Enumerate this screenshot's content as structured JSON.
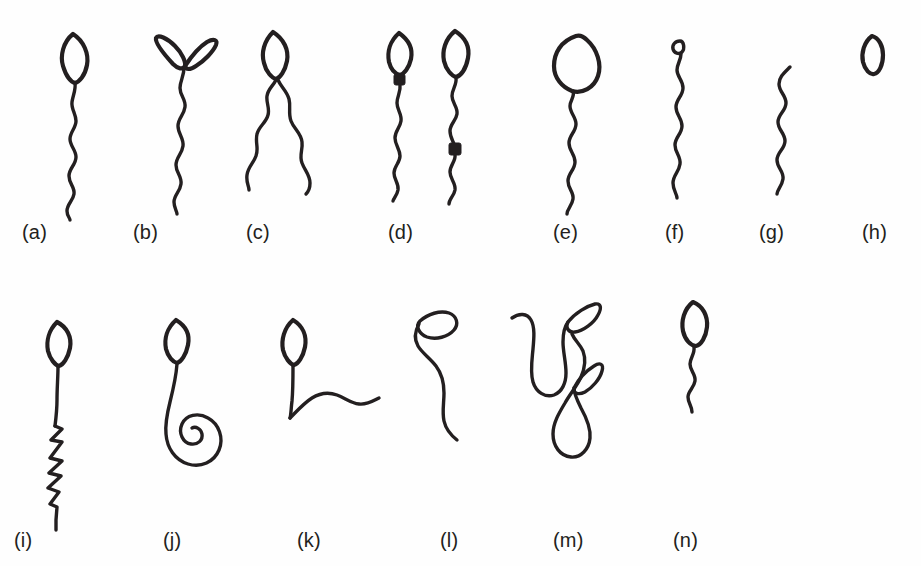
{
  "figure": {
    "background_color": "#fefefe",
    "ink_color": "#231f20",
    "width": 921,
    "height": 566,
    "rows": 2,
    "columns": 8,
    "panel_count": 14
  },
  "labels": {
    "a": "(a)",
    "b": "(b)",
    "c": "(c)",
    "d": "(d)",
    "e": "(e)",
    "f": "(f)",
    "g": "(g)",
    "h": "(h)",
    "i": "(i)",
    "j": "(j)",
    "k": "(k)",
    "l": "(l)",
    "m": "(m)",
    "n": "(n)"
  },
  "panels": [
    {
      "id": "a",
      "label": "(a)",
      "row": 1,
      "index": 1,
      "description": "normal sperm, oval head with wavy tail",
      "head_count": 1,
      "tail_count": 1,
      "droplets": 0
    },
    {
      "id": "b",
      "label": "(b)",
      "row": 1,
      "index": 2,
      "description": "double head, two oval heads on single wavy tail",
      "head_count": 2,
      "tail_count": 1,
      "droplets": 0
    },
    {
      "id": "c",
      "label": "(c)",
      "row": 1,
      "index": 3,
      "description": "double tail, single head with two tails",
      "head_count": 1,
      "tail_count": 2,
      "droplets": 0
    },
    {
      "id": "d",
      "label": "(d)",
      "row": 1,
      "index": 4,
      "description": "two sperm with cytoplasmic droplets, proximal droplet at neck and distal droplet at midpiece",
      "head_count": 2,
      "tail_count": 2,
      "droplets": 2
    },
    {
      "id": "e",
      "label": "(e)",
      "row": 1,
      "index": 5,
      "description": "macrocephalic, enlarged round head",
      "head_count": 1,
      "tail_count": 1,
      "droplets": 0
    },
    {
      "id": "f",
      "label": "(f)",
      "row": 1,
      "index": 6,
      "description": "microcephalic, very small head",
      "head_count": 1,
      "tail_count": 1,
      "droplets": 0
    },
    {
      "id": "g",
      "label": "(g)",
      "row": 1,
      "index": 7,
      "description": "headless tail, free flagellum only",
      "head_count": 0,
      "tail_count": 1,
      "droplets": 0
    },
    {
      "id": "h",
      "label": "(h)",
      "row": 1,
      "index": 8,
      "description": "isolated head, no tail",
      "head_count": 1,
      "tail_count": 0,
      "droplets": 0
    },
    {
      "id": "i",
      "label": "(i)",
      "row": 2,
      "index": 1,
      "description": "zigzag kinked tail",
      "head_count": 1,
      "tail_count": 1,
      "droplets": 0
    },
    {
      "id": "j",
      "label": "(j)",
      "row": 2,
      "index": 2,
      "description": "coiled tail, spiral at distal end",
      "head_count": 1,
      "tail_count": 1,
      "droplets": 0
    },
    {
      "id": "k",
      "label": "(k)",
      "row": 2,
      "index": 3,
      "description": "sharply bent tail at midpiece",
      "head_count": 1,
      "tail_count": 1,
      "droplets": 0
    },
    {
      "id": "l",
      "label": "(l)",
      "row": 2,
      "index": 4,
      "description": "head attached laterally to tail",
      "head_count": 1,
      "tail_count": 1,
      "droplets": 0
    },
    {
      "id": "m",
      "label": "(m)",
      "row": 2,
      "index": 5,
      "description": "two sperm with tails looped around the heads",
      "head_count": 2,
      "tail_count": 2,
      "droplets": 0
    },
    {
      "id": "n",
      "label": "(n)",
      "row": 2,
      "index": 6,
      "description": "short tail, stump tail sperm",
      "head_count": 1,
      "tail_count": 1,
      "droplets": 0
    }
  ],
  "label_positions": {
    "a": {
      "x": 22,
      "y": 221
    },
    "b": {
      "x": 133,
      "y": 221
    },
    "c": {
      "x": 246,
      "y": 221
    },
    "d": {
      "x": 388,
      "y": 221
    },
    "e": {
      "x": 553,
      "y": 221
    },
    "f": {
      "x": 665,
      "y": 221
    },
    "g": {
      "x": 759,
      "y": 221
    },
    "h": {
      "x": 862,
      "y": 221
    },
    "i": {
      "x": 14,
      "y": 529
    },
    "j": {
      "x": 163,
      "y": 529
    },
    "k": {
      "x": 297,
      "y": 529
    },
    "l": {
      "x": 440,
      "y": 529
    },
    "m": {
      "x": 553,
      "y": 529
    },
    "n": {
      "x": 673,
      "y": 529
    }
  }
}
